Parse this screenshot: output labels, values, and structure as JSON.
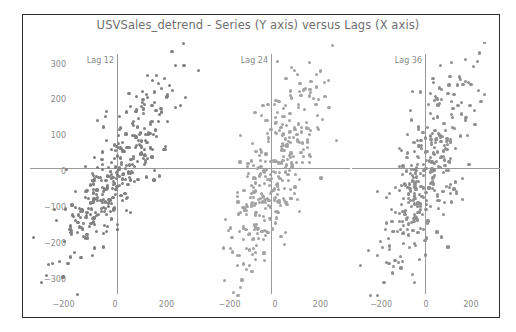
{
  "chart_data": {
    "type": "scatter",
    "title": "USVSales_detrend - Series (Y axis) versus  Lags (X axis)",
    "xlabel": "Lags (X axis)",
    "ylabel": "Series (Y axis)",
    "grid": false,
    "legend": false,
    "xlim": [
      -330,
      330
    ],
    "ylim": [
      -360,
      360
    ],
    "yticks": [
      300,
      200,
      100,
      0,
      -100,
      -200,
      -300
    ],
    "yticklabels": [
      "300",
      "200",
      "100",
      "0",
      "−100",
      "−200",
      "−300"
    ],
    "xticks": [
      -200,
      0,
      200
    ],
    "xticklabels": [
      "−200",
      "0",
      "200"
    ],
    "point_color": "#8c8c8c",
    "axis_line_color": "#9a9a9a",
    "frame_color": "#2b2b2b",
    "text_color": "#8a8a8a",
    "title_color": "#6f6f6f",
    "n_points_per_panel": 330,
    "panels": [
      {
        "label": "Lag 12",
        "lag": 12,
        "correlation": 0.82,
        "point_color": "#808080",
        "point_size": 3.2,
        "x_sd": 112,
        "y_sd": 128,
        "seed": 12
      },
      {
        "label": "Lag 24",
        "lag": 24,
        "correlation": 0.7,
        "point_color": "#a3a3a3",
        "point_size": 3.2,
        "x_sd": 104,
        "y_sd": 132,
        "seed": 24
      },
      {
        "label": "Lag 36",
        "lag": 36,
        "correlation": 0.66,
        "point_color": "#8f8f8f",
        "point_size": 3.2,
        "x_sd": 100,
        "y_sd": 134,
        "seed": 36
      }
    ]
  },
  "figure": {
    "width": 516,
    "height": 332,
    "background": "#ffffff"
  }
}
